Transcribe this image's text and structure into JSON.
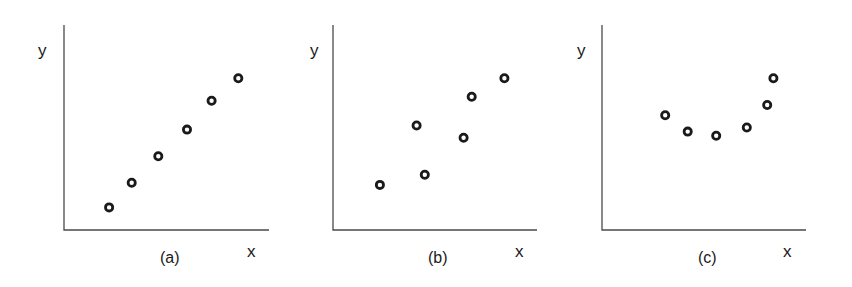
{
  "chart_data": [
    {
      "type": "scatter",
      "panel": "(a)",
      "title": "",
      "xlabel": "x",
      "ylabel": "y",
      "caption": "(a)",
      "grid": false,
      "ticks": false,
      "description": "strong positive linear relationship",
      "x": [
        0.22,
        0.33,
        0.46,
        0.6,
        0.72,
        0.85
      ],
      "y": [
        0.11,
        0.23,
        0.36,
        0.49,
        0.63,
        0.74
      ],
      "xlim": [
        0,
        1
      ],
      "ylim": [
        0,
        1
      ]
    },
    {
      "type": "scatter",
      "panel": "(b)",
      "title": "",
      "xlabel": "x",
      "ylabel": "y",
      "caption": "(b)",
      "grid": false,
      "ticks": false,
      "description": "weaker positive relationship with more scatter",
      "x": [
        0.23,
        0.45,
        0.41,
        0.64,
        0.68,
        0.84
      ],
      "y": [
        0.22,
        0.27,
        0.51,
        0.45,
        0.65,
        0.74
      ],
      "xlim": [
        0,
        1
      ],
      "ylim": [
        0,
        1
      ]
    },
    {
      "type": "scatter",
      "panel": "(c)",
      "title": "",
      "xlabel": "x",
      "ylabel": "y",
      "caption": "(c)",
      "grid": false,
      "ticks": false,
      "description": "nonlinear (U-shaped / curved) relationship",
      "x": [
        0.31,
        0.42,
        0.56,
        0.71,
        0.81,
        0.84
      ],
      "y": [
        0.56,
        0.48,
        0.46,
        0.5,
        0.61,
        0.74
      ],
      "xlim": [
        0,
        1
      ],
      "ylim": [
        0,
        1
      ]
    }
  ],
  "panels": [
    {
      "ylabel": "y",
      "xlabel": "x",
      "caption": "(a)"
    },
    {
      "ylabel": "y",
      "xlabel": "x",
      "caption": "(b)"
    },
    {
      "ylabel": "y",
      "xlabel": "x",
      "caption": "(c)"
    }
  ],
  "style": {
    "axis_color": "#4a4a4a",
    "marker_color": "#1a1a1a",
    "marker_fill": "#ffffff"
  }
}
